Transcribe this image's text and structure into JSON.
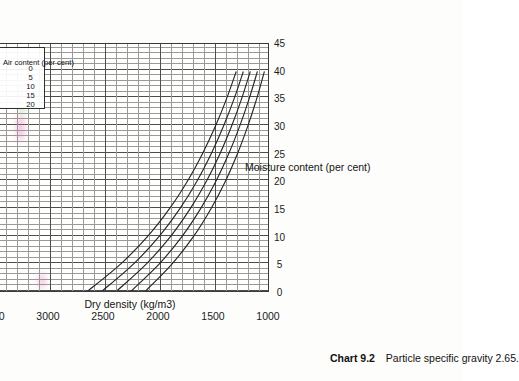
{
  "caption": {
    "label": "Chart 9.2",
    "text": "Particle specific gravity 2.65."
  },
  "chart_data": {
    "type": "line",
    "title": "",
    "xlabel": "Moisture content (per cent)",
    "ylabel": "Dry density (kg/m3)",
    "xlim": [
      0,
      45
    ],
    "ylim": [
      1000,
      3500
    ],
    "xticks": [
      0,
      5,
      10,
      15,
      20,
      25,
      30,
      35,
      40,
      45
    ],
    "yticks": [
      1000,
      1500,
      2000,
      2500,
      3000,
      3500
    ],
    "grid": true,
    "legend": {
      "position": "inside-top-right",
      "title": "Air content (per cent)",
      "entries": [
        "0",
        "5",
        "10",
        "15",
        "20"
      ]
    },
    "series": [
      {
        "name": "0",
        "air_content": 0,
        "x": [
          0,
          5,
          10,
          15,
          20,
          25,
          30,
          35,
          40
        ],
        "y": [
          2650,
          2345,
          2100,
          1902,
          1738,
          1600,
          1482,
          1380,
          1291
        ]
      },
      {
        "name": "5",
        "air_content": 5,
        "x": [
          0,
          5,
          10,
          15,
          20,
          25,
          30,
          35,
          40
        ],
        "y": [
          2518,
          2228,
          1995,
          1807,
          1651,
          1520,
          1408,
          1311,
          1226
        ]
      },
      {
        "name": "10",
        "air_content": 10,
        "x": [
          0,
          5,
          10,
          15,
          20,
          25,
          30,
          35,
          40
        ],
        "y": [
          2385,
          2111,
          1890,
          1712,
          1564,
          1440,
          1334,
          1242,
          1162
        ]
      },
      {
        "name": "15",
        "air_content": 15,
        "x": [
          0,
          5,
          10,
          15,
          20,
          25,
          30,
          35,
          40
        ],
        "y": [
          2253,
          1993,
          1785,
          1617,
          1477,
          1360,
          1260,
          1173,
          1097
        ]
      },
      {
        "name": "20",
        "air_content": 20,
        "x": [
          0,
          5,
          10,
          15,
          20,
          25,
          30,
          35,
          40
        ],
        "y": [
          2120,
          1876,
          1680,
          1522,
          1390,
          1280,
          1186,
          1104,
          1033
        ]
      }
    ]
  }
}
